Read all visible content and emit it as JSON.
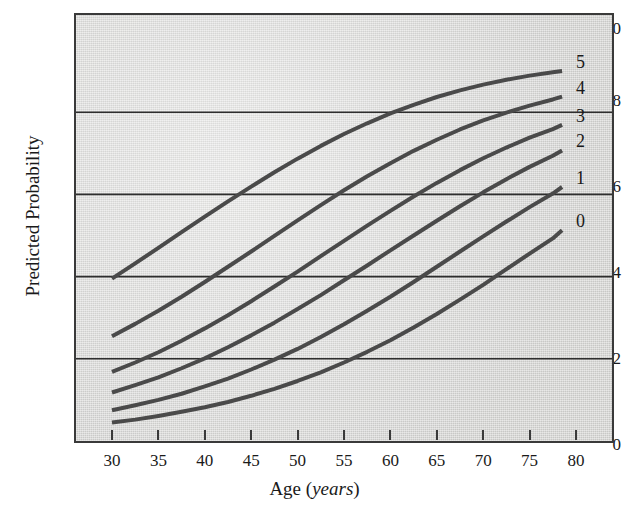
{
  "chart_data": {
    "type": "line",
    "title": "",
    "xlabel": "Age (years)",
    "xlabel_plain": "Age",
    "xlabel_italic": "years",
    "ylabel": "Predicted Probability",
    "xlim": [
      30,
      80
    ],
    "ylim": [
      0,
      1.0
    ],
    "xticks": [
      30,
      35,
      40,
      45,
      50,
      55,
      60,
      65,
      70,
      75,
      80
    ],
    "xtick_labels": [
      "30",
      "35",
      "40",
      "45",
      "50",
      "55",
      "60",
      "65",
      "70",
      "75",
      "80"
    ],
    "yticks": [
      0,
      0.2,
      0.4,
      0.6,
      0.8,
      1.0
    ],
    "ytick_labels": [
      "0",
      "0.2",
      "0.4",
      "0.6",
      "0.8",
      "1.0"
    ],
    "grid": "horizontal",
    "grid_color": "#2e2e2e",
    "plot_background": "#dcdcda",
    "line_color": "#4a4a4a",
    "line_width": 4,
    "legend_position": "right-end-of-line",
    "x": [
      30,
      32.5,
      35,
      37.5,
      40,
      42.5,
      45,
      47.5,
      50,
      52.5,
      55,
      57.5,
      60,
      62.5,
      65,
      67.5,
      70,
      72.5,
      75,
      77.5,
      78.5
    ],
    "series": [
      {
        "name": "5",
        "label": "5",
        "values": [
          0.395,
          0.432,
          0.47,
          0.508,
          0.546,
          0.583,
          0.619,
          0.654,
          0.687,
          0.718,
          0.747,
          0.773,
          0.797,
          0.818,
          0.837,
          0.853,
          0.867,
          0.879,
          0.889,
          0.897,
          0.9
        ]
      },
      {
        "name": "4",
        "label": "4",
        "values": [
          0.255,
          0.285,
          0.317,
          0.351,
          0.387,
          0.424,
          0.461,
          0.499,
          0.537,
          0.574,
          0.61,
          0.644,
          0.676,
          0.706,
          0.733,
          0.758,
          0.78,
          0.799,
          0.816,
          0.831,
          0.838
        ]
      },
      {
        "name": "3",
        "label": "3",
        "values": [
          0.168,
          0.191,
          0.216,
          0.244,
          0.274,
          0.306,
          0.34,
          0.376,
          0.412,
          0.45,
          0.487,
          0.524,
          0.56,
          0.595,
          0.628,
          0.659,
          0.688,
          0.714,
          0.738,
          0.759,
          0.769
        ]
      },
      {
        "name": "2",
        "label": "2",
        "values": [
          0.118,
          0.136,
          0.155,
          0.177,
          0.201,
          0.228,
          0.257,
          0.288,
          0.321,
          0.355,
          0.391,
          0.427,
          0.464,
          0.5,
          0.536,
          0.571,
          0.605,
          0.637,
          0.667,
          0.694,
          0.707
        ]
      },
      {
        "name": "1",
        "label": "1",
        "values": [
          0.075,
          0.087,
          0.1,
          0.115,
          0.133,
          0.152,
          0.174,
          0.198,
          0.224,
          0.253,
          0.284,
          0.317,
          0.351,
          0.387,
          0.424,
          0.461,
          0.498,
          0.534,
          0.569,
          0.602,
          0.618
        ]
      },
      {
        "name": "0",
        "label": "0",
        "values": [
          0.045,
          0.052,
          0.061,
          0.071,
          0.082,
          0.095,
          0.11,
          0.127,
          0.146,
          0.167,
          0.191,
          0.217,
          0.245,
          0.276,
          0.309,
          0.344,
          0.38,
          0.418,
          0.456,
          0.493,
          0.513
        ]
      }
    ],
    "series_end_labels": [
      "5",
      "4",
      "3",
      "2",
      "1",
      "0"
    ]
  },
  "axis": {
    "y_title": "Predicted Probability",
    "x_title_plain": "Age (",
    "x_title_italic": "years",
    "x_title_close": ")"
  }
}
